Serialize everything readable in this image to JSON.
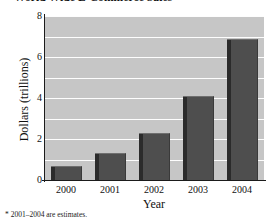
{
  "chart_data": {
    "type": "bar",
    "title": "World Wide E-Commerce Sales",
    "xlabel": "Year",
    "ylabel": "Dollars (trillions)",
    "categories": [
      "2000",
      "2001",
      "2002",
      "2003",
      "2004"
    ],
    "values": [
      0.7,
      1.3,
      2.3,
      4.1,
      6.9
    ],
    "ylim": [
      0,
      8
    ],
    "ytick_labels": [
      "0",
      "2",
      "4",
      "6",
      "8"
    ],
    "ytick_values": [
      0,
      2,
      4,
      6,
      8
    ],
    "gridlines_at": [
      1,
      2,
      3,
      4,
      5,
      6,
      7,
      8
    ],
    "grid": true,
    "legend": "none",
    "footnote": "* 2001–2004 are estimates.",
    "colors": {
      "plot_background": "#c6c6c6",
      "gridline": "#fdfdfd",
      "bar_face": "#4e4e4e",
      "bar_side": "#2b2b2b",
      "axis": "#1b1b1b",
      "text": "#111111",
      "page_background": "#ffffff"
    }
  }
}
